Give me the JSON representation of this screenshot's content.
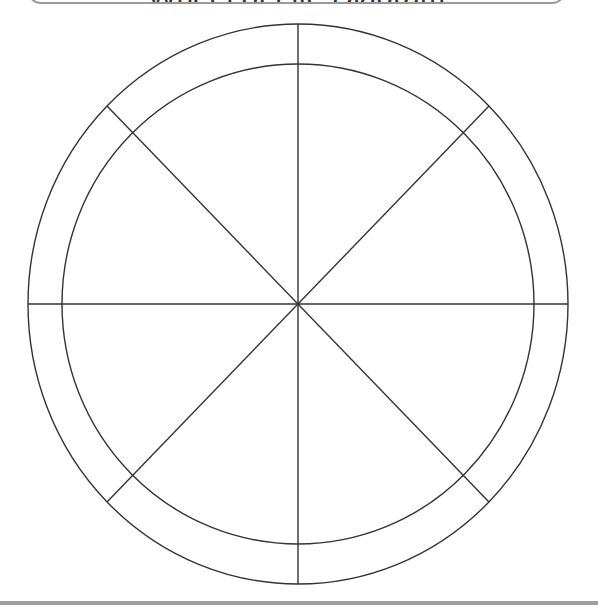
{
  "title": {
    "text": "Wheel of Life Diagram",
    "border_color": "#9a9a9a"
  },
  "wheel": {
    "center": [
      298,
      304
    ],
    "outer_radius": [
      270,
      280
    ],
    "inner_radius": [
      236,
      240
    ],
    "segments": 8,
    "segment_labels": [
      "",
      "",
      "",
      "",
      "",
      "",
      "",
      ""
    ],
    "stroke_color": "#333333"
  },
  "footer": {
    "bar_color": "#9e9e9e"
  }
}
